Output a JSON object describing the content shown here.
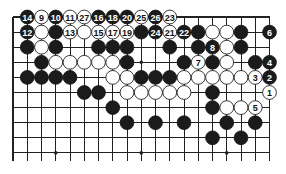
{
  "diagram": {
    "type": "go-board-partial",
    "columns": 19,
    "visible_rows": 10,
    "edges": [
      "top",
      "left",
      "right"
    ],
    "colors": {
      "black": "#1b1b1b",
      "white": "#ffffff",
      "line": "#222222",
      "background": "#ffffff"
    },
    "hoshi": [
      [
        9,
        3
      ],
      [
        9,
        9
      ],
      [
        9,
        15
      ],
      [
        3,
        9
      ]
    ],
    "stones": [
      {
        "r": 0,
        "c": 1,
        "color": "B",
        "label": "14"
      },
      {
        "r": 0,
        "c": 2,
        "color": "W",
        "label": "9"
      },
      {
        "r": 0,
        "c": 3,
        "color": "B",
        "label": "10"
      },
      {
        "r": 0,
        "c": 4,
        "color": "W",
        "label": "11"
      },
      {
        "r": 0,
        "c": 5,
        "color": "W",
        "label": "27"
      },
      {
        "r": 0,
        "c": 6,
        "color": "B",
        "label": "16"
      },
      {
        "r": 0,
        "c": 7,
        "color": "B",
        "label": "18"
      },
      {
        "r": 0,
        "c": 8,
        "color": "B",
        "label": "20"
      },
      {
        "r": 0,
        "c": 9,
        "color": "W",
        "label": "25"
      },
      {
        "r": 0,
        "c": 10,
        "color": "B",
        "label": "26"
      },
      {
        "r": 0,
        "c": 11,
        "color": "W",
        "label": "23"
      },
      {
        "r": 1,
        "c": 1,
        "color": "B",
        "label": "12"
      },
      {
        "r": 1,
        "c": 2,
        "color": "W",
        "label": ""
      },
      {
        "r": 1,
        "c": 3,
        "color": "B",
        "label": ""
      },
      {
        "r": 1,
        "c": 4,
        "color": "W",
        "label": "13"
      },
      {
        "r": 1,
        "c": 5,
        "color": "W",
        "label": ""
      },
      {
        "r": 1,
        "c": 6,
        "color": "W",
        "label": "15"
      },
      {
        "r": 1,
        "c": 7,
        "color": "W",
        "label": "17"
      },
      {
        "r": 1,
        "c": 8,
        "color": "W",
        "label": "19"
      },
      {
        "r": 1,
        "c": 9,
        "color": "B",
        "label": ""
      },
      {
        "r": 1,
        "c": 10,
        "color": "B",
        "label": "24"
      },
      {
        "r": 1,
        "c": 11,
        "color": "W",
        "label": "21"
      },
      {
        "r": 1,
        "c": 12,
        "color": "B",
        "label": "22"
      },
      {
        "r": 1,
        "c": 13,
        "color": "B",
        "label": ""
      },
      {
        "r": 1,
        "c": 14,
        "color": "W",
        "label": ""
      },
      {
        "r": 1,
        "c": 15,
        "color": "W",
        "label": ""
      },
      {
        "r": 1,
        "c": 16,
        "color": "B",
        "label": ""
      },
      {
        "r": 1,
        "c": 18,
        "color": "B",
        "label": "6"
      },
      {
        "r": 2,
        "c": 1,
        "color": "B",
        "label": ""
      },
      {
        "r": 2,
        "c": 2,
        "color": "W",
        "label": ""
      },
      {
        "r": 2,
        "c": 3,
        "color": "B",
        "label": ""
      },
      {
        "r": 2,
        "c": 6,
        "color": "B",
        "label": ""
      },
      {
        "r": 2,
        "c": 7,
        "color": "B",
        "label": ""
      },
      {
        "r": 2,
        "c": 8,
        "color": "B",
        "label": ""
      },
      {
        "r": 2,
        "c": 11,
        "color": "B",
        "label": ""
      },
      {
        "r": 2,
        "c": 13,
        "color": "B",
        "label": ""
      },
      {
        "r": 2,
        "c": 14,
        "color": "B",
        "label": "8"
      },
      {
        "r": 2,
        "c": 15,
        "color": "W",
        "label": ""
      },
      {
        "r": 2,
        "c": 16,
        "color": "B",
        "label": ""
      },
      {
        "r": 3,
        "c": 2,
        "color": "B",
        "label": ""
      },
      {
        "r": 3,
        "c": 3,
        "color": "W",
        "label": ""
      },
      {
        "r": 3,
        "c": 4,
        "color": "W",
        "label": ""
      },
      {
        "r": 3,
        "c": 5,
        "color": "W",
        "label": ""
      },
      {
        "r": 3,
        "c": 6,
        "color": "W",
        "label": ""
      },
      {
        "r": 3,
        "c": 7,
        "color": "W",
        "label": ""
      },
      {
        "r": 3,
        "c": 8,
        "color": "B",
        "label": ""
      },
      {
        "r": 3,
        "c": 12,
        "color": "B",
        "label": ""
      },
      {
        "r": 3,
        "c": 13,
        "color": "W",
        "label": "7"
      },
      {
        "r": 3,
        "c": 14,
        "color": "B",
        "label": ""
      },
      {
        "r": 3,
        "c": 15,
        "color": "W",
        "label": ""
      },
      {
        "r": 3,
        "c": 17,
        "color": "B",
        "label": ""
      },
      {
        "r": 3,
        "c": 18,
        "color": "B",
        "label": "4"
      },
      {
        "r": 4,
        "c": 1,
        "color": "B",
        "label": ""
      },
      {
        "r": 4,
        "c": 2,
        "color": "B",
        "label": ""
      },
      {
        "r": 4,
        "c": 3,
        "color": "B",
        "label": ""
      },
      {
        "r": 4,
        "c": 4,
        "color": "B",
        "label": ""
      },
      {
        "r": 4,
        "c": 7,
        "color": "W",
        "label": ""
      },
      {
        "r": 4,
        "c": 8,
        "color": "W",
        "label": ""
      },
      {
        "r": 4,
        "c": 9,
        "color": "B",
        "label": ""
      },
      {
        "r": 4,
        "c": 10,
        "color": "B",
        "label": ""
      },
      {
        "r": 4,
        "c": 11,
        "color": "B",
        "label": ""
      },
      {
        "r": 4,
        "c": 12,
        "color": "W",
        "label": ""
      },
      {
        "r": 4,
        "c": 13,
        "color": "W",
        "label": ""
      },
      {
        "r": 4,
        "c": 14,
        "color": "W",
        "label": ""
      },
      {
        "r": 4,
        "c": 15,
        "color": "W",
        "label": ""
      },
      {
        "r": 4,
        "c": 16,
        "color": "W",
        "label": ""
      },
      {
        "r": 4,
        "c": 17,
        "color": "W",
        "label": "3"
      },
      {
        "r": 4,
        "c": 18,
        "color": "B",
        "label": "2"
      },
      {
        "r": 5,
        "c": 5,
        "color": "B",
        "label": ""
      },
      {
        "r": 5,
        "c": 6,
        "color": "B",
        "label": ""
      },
      {
        "r": 5,
        "c": 8,
        "color": "W",
        "label": ""
      },
      {
        "r": 5,
        "c": 9,
        "color": "W",
        "label": ""
      },
      {
        "r": 5,
        "c": 10,
        "color": "W",
        "label": ""
      },
      {
        "r": 5,
        "c": 11,
        "color": "W",
        "label": ""
      },
      {
        "r": 5,
        "c": 12,
        "color": "W",
        "label": ""
      },
      {
        "r": 5,
        "c": 14,
        "color": "B",
        "label": ""
      },
      {
        "r": 5,
        "c": 18,
        "color": "W",
        "label": "1"
      },
      {
        "r": 6,
        "c": 7,
        "color": "B",
        "label": ""
      },
      {
        "r": 6,
        "c": 14,
        "color": "B",
        "label": ""
      },
      {
        "r": 6,
        "c": 15,
        "color": "W",
        "label": ""
      },
      {
        "r": 6,
        "c": 16,
        "color": "W",
        "label": ""
      },
      {
        "r": 6,
        "c": 17,
        "color": "W",
        "label": "5"
      },
      {
        "r": 7,
        "c": 8,
        "color": "B",
        "label": ""
      },
      {
        "r": 7,
        "c": 10,
        "color": "B",
        "label": ""
      },
      {
        "r": 7,
        "c": 12,
        "color": "B",
        "label": ""
      },
      {
        "r": 7,
        "c": 15,
        "color": "B",
        "label": ""
      },
      {
        "r": 7,
        "c": 17,
        "color": "B",
        "label": ""
      },
      {
        "r": 8,
        "c": 14,
        "color": "B",
        "label": ""
      },
      {
        "r": 8,
        "c": 16,
        "color": "B",
        "label": ""
      }
    ]
  }
}
